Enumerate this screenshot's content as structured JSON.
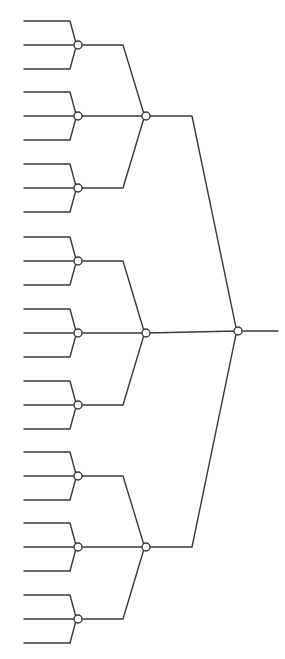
{
  "diagram": {
    "type": "ternary-tree",
    "colors": {
      "stroke": "#3a3a3a",
      "background": "#ffffff",
      "node_fill": "#ffffff"
    },
    "node_radius": 4,
    "leaf": {
      "x_start": 24,
      "x_kink": 70,
      "spread": 24
    },
    "level1": {
      "x": 78,
      "kink_x": 123,
      "ys": [
        45,
        116,
        188,
        261,
        333,
        405,
        476,
        547,
        619
      ]
    },
    "level2": {
      "x": 146,
      "kink_x": 192,
      "ys": [
        116,
        333,
        547
      ]
    },
    "root": {
      "x": 238,
      "y": 331,
      "output_x": 278
    }
  }
}
